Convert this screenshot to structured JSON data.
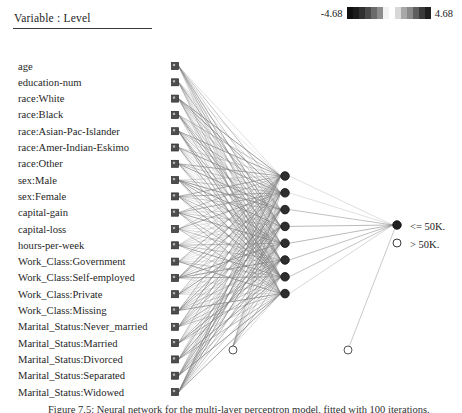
{
  "header": {
    "title": "Variable : Level",
    "legend": {
      "min_label": "-4.68",
      "max_label": "4.68",
      "swatch_colors": [
        "#101010",
        "#1c1c1c",
        "#303030",
        "#4a4a4a",
        "#6b6b6b",
        "#8c8c8c",
        "#f2f2f2",
        "#ffffff",
        "#d8d8d8",
        "#a8a8a8",
        "#8a8a8a",
        "#5e5e5e",
        "#3a3a3a",
        "#1f1f1f"
      ]
    }
  },
  "network": {
    "input_labels": [
      "age",
      "education-num",
      "race:White",
      "race:Black",
      "race:Asian-Pac-Islander",
      "race:Amer-Indian-Eskimo",
      "race:Other",
      "sex:Male",
      "sex:Female",
      "capital-gain",
      "capital-loss",
      "hours-per-week",
      "Work_Class:Government",
      "Work_Class:Self-employed",
      "Work_Class:Private",
      "Work_Class:Missing",
      "Marital_Status:Never_married",
      "Marital_Status:Married",
      "Marital_Status:Divorced",
      "Marital_Status:Separated",
      "Marital_Status:Widowed"
    ],
    "hidden_node_count": 8,
    "bias_node_count": 2,
    "output_labels": [
      "<= 50K.",
      "> 50K."
    ],
    "node_colors": {
      "input_square_fill": "#4d4d4d",
      "hidden_circle_fill": "#2e2e2e",
      "output_circle_fill": "#1f1f1f",
      "bias_circle_stroke": "#555555",
      "edge_color": "#7d7d7d"
    }
  },
  "caption": {
    "text": "Figure 7.5:  Neural network for the multi-layer perceptron model, fitted with 100 iterations."
  },
  "chart_data": {
    "type": "diagram",
    "title": "Variable : Level",
    "subtype": "neural-network-architecture",
    "layers": [
      {
        "name": "input",
        "node_shape": "square",
        "count": 21,
        "labels": [
          "age",
          "education-num",
          "race:White",
          "race:Black",
          "race:Asian-Pac-Islander",
          "race:Amer-Indian-Eskimo",
          "race:Other",
          "sex:Male",
          "sex:Female",
          "capital-gain",
          "capital-loss",
          "hours-per-week",
          "Work_Class:Government",
          "Work_Class:Self-employed",
          "Work_Class:Private",
          "Work_Class:Missing",
          "Marital_Status:Never_married",
          "Marital_Status:Married",
          "Marital_Status:Divorced",
          "Marital_Status:Separated",
          "Marital_Status:Widowed"
        ]
      },
      {
        "name": "hidden",
        "node_shape": "filled-circle",
        "count": 8,
        "labels": []
      },
      {
        "name": "output",
        "node_shape": "circle",
        "count": 2,
        "labels": [
          "<= 50K.",
          "> 50K."
        ]
      },
      {
        "name": "bias",
        "node_shape": "open-circle",
        "count": 2,
        "labels": []
      }
    ],
    "colorbar": {
      "label": "Variable : Level",
      "min": -4.68,
      "max": 4.68,
      "min_label": "-4.68",
      "max_label": "4.68",
      "scale": "grayscale-diverging"
    }
  }
}
